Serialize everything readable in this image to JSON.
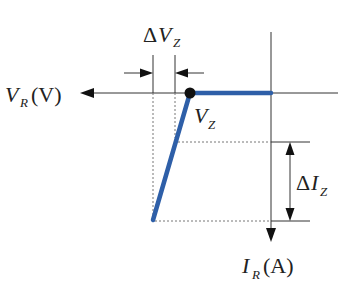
{
  "diagram": {
    "type": "zener-diode-reverse-characteristic",
    "colors": {
      "curve": "#2e5fa8",
      "axis": "#333333",
      "dashed": "#666666",
      "dot": "#111111",
      "background": "#ffffff"
    },
    "labels": {
      "x_axis": {
        "symbol": "V",
        "subscript": "R",
        "unit": "(V)"
      },
      "y_axis": {
        "symbol": "I",
        "subscript": "R",
        "unit": "(A)"
      },
      "knee": {
        "symbol": "V",
        "subscript": "Z"
      },
      "delta_v": {
        "prefix": "Δ",
        "symbol": "V",
        "subscript": "Z"
      },
      "delta_i": {
        "prefix": "Δ",
        "symbol": "I",
        "subscript": "Z"
      }
    }
  }
}
